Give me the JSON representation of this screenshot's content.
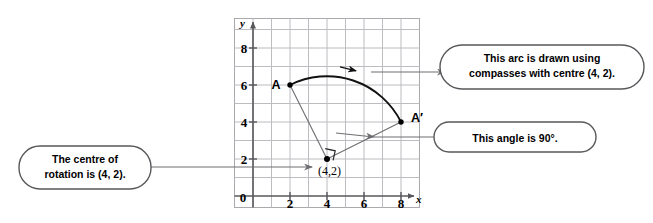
{
  "figure": {
    "grid": {
      "x_min": -1,
      "x_max": 9,
      "y_min": -1,
      "y_max": 9,
      "x_ticks": [
        0,
        2,
        4,
        6,
        8
      ],
      "y_ticks": [
        0,
        2,
        4,
        6,
        8
      ],
      "grid_color": "#b9b9bd",
      "axis_color": "#58585c",
      "grid_on": true
    },
    "axis_labels": {
      "x": "x",
      "y": "y"
    },
    "points": [
      {
        "name": "A",
        "label": "A",
        "x": 2,
        "y": 6
      },
      {
        "name": "A-prime",
        "label": "A′",
        "x": 8,
        "y": 4
      },
      {
        "name": "centre",
        "label": "(4,2)",
        "x": 4,
        "y": 2
      }
    ],
    "arc": {
      "centre_x": 4,
      "centre_y": 2,
      "radius": 4.47,
      "start_point": "A",
      "end_point": "A-prime",
      "direction": "clockwise",
      "colour": "#000000"
    },
    "angle_marker": {
      "label": "90°",
      "vertex_x": 4,
      "vertex_y": 2,
      "type": "right-angle-square"
    }
  },
  "callouts": [
    {
      "id": "arc-callout",
      "line1": "This arc is drawn using",
      "line2": "compasses with centre (4, 2).",
      "position": "top-right"
    },
    {
      "id": "angle-callout",
      "line1": "This angle is 90°.",
      "line2": "",
      "position": "middle-right"
    },
    {
      "id": "centre-callout",
      "line1": "The centre of",
      "line2": "rotation is (4, 2).",
      "position": "bottom-left"
    }
  ],
  "colors": {
    "ink": "#000000",
    "grid": "#b9b9bd",
    "axis": "#58585c",
    "leader": "#6e6e72",
    "callout_border": "#58585c",
    "callout_fill": "#ffffff",
    "background": "#ffffff"
  }
}
